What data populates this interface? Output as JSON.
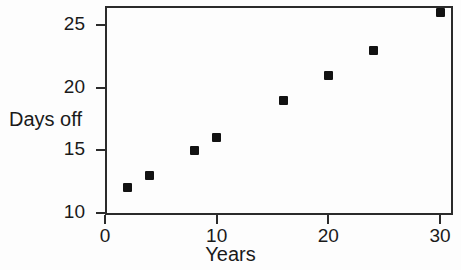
{
  "chart_data": {
    "type": "scatter",
    "title": "",
    "xlabel": "Years",
    "ylabel": "Days off",
    "xlim": [
      0,
      31
    ],
    "ylim": [
      9,
      26.8
    ],
    "grid": false,
    "legend": null,
    "marker": "square",
    "marker_color": "#121212",
    "x": [
      2,
      4,
      8,
      10,
      16,
      20,
      24,
      30
    ],
    "y": [
      12,
      13,
      15,
      16,
      19,
      21,
      23,
      26
    ],
    "points": [
      {
        "x": 2,
        "y": 12
      },
      {
        "x": 4,
        "y": 13
      },
      {
        "x": 8,
        "y": 15
      },
      {
        "x": 10,
        "y": 16
      },
      {
        "x": 16,
        "y": 19
      },
      {
        "x": 20,
        "y": 21
      },
      {
        "x": 24,
        "y": 23
      },
      {
        "x": 30,
        "y": 26
      }
    ],
    "xticks": [
      0,
      10,
      20,
      30
    ],
    "xtick_labels": [
      "0",
      "10",
      "20",
      "30"
    ],
    "yticks": [
      10,
      15,
      20,
      25
    ],
    "ytick_labels": [
      "10",
      "15",
      "20",
      "25"
    ]
  },
  "axes": {
    "y_title": "Days off",
    "x_title": "Years",
    "y_labels": [
      "25",
      "20",
      "15",
      "10"
    ],
    "x_labels": [
      "0",
      "10",
      "20",
      "30"
    ]
  },
  "colors": {
    "axis": "#2b2b2b",
    "marker": "#121212",
    "background": "#fdfdfd",
    "text": "#1a1a1a"
  }
}
